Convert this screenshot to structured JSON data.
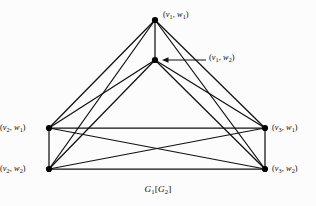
{
  "figure": {
    "caption_html": "<i>G</i><sub>1</sub>[<i>G</i><sub>2</sub>]",
    "caption_text": "G1[G2]",
    "background_color": "#fcfcfc",
    "stroke_color": "#111111",
    "vertex_color": "#000000",
    "width": 316,
    "height": 206
  },
  "graph": {
    "type": "lexicographic-product",
    "vertex_count": 6,
    "edge_count": 15,
    "is_complete": true,
    "vertices": [
      {
        "id": "v1w1",
        "label_html": "(<i>v</i><sub>1</sub>, <i>w</i><sub>1</sub>)",
        "label_text": "(v1, w1)",
        "x": 155,
        "y": 20,
        "label_x": 163,
        "label_y": 11,
        "label_anchor": "left"
      },
      {
        "id": "v1w2",
        "label_html": "(<i>v</i><sub>1</sub>, <i>w</i><sub>2</sub>)",
        "label_text": "(v1, w2)",
        "x": 155,
        "y": 60,
        "label_x": 209,
        "label_y": 54,
        "label_anchor": "left"
      },
      {
        "id": "v2w1",
        "label_html": "(<i>v</i><sub>2</sub>, <i>w</i><sub>1</sub>)",
        "label_text": "(v2, w1)",
        "x": 49,
        "y": 128,
        "label_x": 10,
        "label_y": 124,
        "label_anchor": "right"
      },
      {
        "id": "v2w2",
        "label_html": "(<i>v</i><sub>2</sub>, <i>w</i><sub>2</sub>)",
        "label_text": "(v2, w2)",
        "x": 49,
        "y": 169,
        "label_x": 10,
        "label_y": 165,
        "label_anchor": "right"
      },
      {
        "id": "v3w1",
        "label_html": "(<i>v</i><sub>3</sub>, <i>w</i><sub>1</sub>)",
        "label_text": "(v3, w1)",
        "x": 265,
        "y": 128,
        "label_x": 272,
        "label_y": 124,
        "label_anchor": "left"
      },
      {
        "id": "v3w2",
        "label_html": "(<i>v</i><sub>3</sub>, <i>w</i><sub>2</sub>)",
        "label_text": "(v3, w2)",
        "x": 265,
        "y": 169,
        "label_x": 272,
        "label_y": 165,
        "label_anchor": "left"
      }
    ],
    "edges": [
      [
        "v1w1",
        "v1w2"
      ],
      [
        "v1w1",
        "v2w1"
      ],
      [
        "v1w1",
        "v2w2"
      ],
      [
        "v1w1",
        "v3w1"
      ],
      [
        "v1w1",
        "v3w2"
      ],
      [
        "v1w2",
        "v2w1"
      ],
      [
        "v1w2",
        "v2w2"
      ],
      [
        "v1w2",
        "v3w1"
      ],
      [
        "v1w2",
        "v3w2"
      ],
      [
        "v2w1",
        "v2w2"
      ],
      [
        "v2w1",
        "v3w1"
      ],
      [
        "v2w1",
        "v3w2"
      ],
      [
        "v2w2",
        "v3w1"
      ],
      [
        "v2w2",
        "v3w2"
      ],
      [
        "v3w1",
        "v3w2"
      ]
    ],
    "annotation_arrow": {
      "from_x": 206,
      "from_y": 60,
      "to_x": 162,
      "to_y": 60,
      "points_to": "v1w2"
    }
  }
}
